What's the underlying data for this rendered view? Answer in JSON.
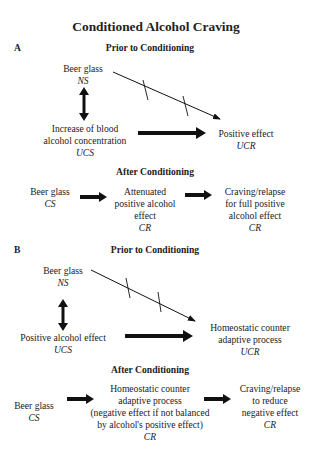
{
  "title": "Conditioned Alcohol Craving",
  "panel_a": {
    "label": "A",
    "prior": {
      "heading": "Prior to Conditioning",
      "ns": {
        "text": "Beer glass",
        "tag": "NS"
      },
      "ucs": {
        "line1": "Increase of blood",
        "line2": "alcohol concentration",
        "tag": "UCS"
      },
      "ucr": {
        "text": "Positive effect",
        "tag": "UCR"
      }
    },
    "after": {
      "heading": "After Conditioning",
      "cs": {
        "text": "Beer glass",
        "tag": "CS"
      },
      "cr1": {
        "line1": "Attenuated",
        "line2": "positive alcohol",
        "line3": "effect",
        "tag": "CR"
      },
      "cr2": {
        "line1": "Craving/relapse",
        "line2": "for full positive",
        "line3": "alcohol effect",
        "tag": "CR"
      }
    }
  },
  "panel_b": {
    "label": "B",
    "prior": {
      "heading": "Prior to Conditioning",
      "ns": {
        "text": "Beer glass",
        "tag": "NS"
      },
      "ucs": {
        "text": "Positive alcohol effect",
        "tag": "UCS"
      },
      "ucr": {
        "line1": "Homeostatic counter",
        "line2": "adaptive process",
        "tag": "UCR"
      }
    },
    "after": {
      "heading": "After Conditioning",
      "cs": {
        "text": "Beer glass",
        "tag": "CS"
      },
      "cr1": {
        "line1": "Homeostatic counter",
        "line2": "adaptive process",
        "line3": "(negative effect if not balanced",
        "line4": "by alcohol's positive effect)",
        "tag": "CR"
      },
      "cr2": {
        "line1": "Craving/relapse",
        "line2": "to reduce",
        "line3": "negative effect",
        "tag": "CR"
      }
    }
  },
  "colors": {
    "text": "#222222",
    "arrow": "#111111"
  }
}
